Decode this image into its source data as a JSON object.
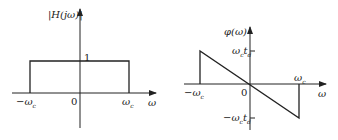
{
  "left_plot": {
    "y_label": "|H(jω)|",
    "level_label": "1",
    "origin_label": "0",
    "neg_cutoff_label": "−ω",
    "neg_cutoff_sub": "c",
    "pos_cutoff_label": "ω",
    "pos_cutoff_sub": "c",
    "x_label": "ω"
  },
  "right_plot": {
    "y_label": "φ(ω)",
    "top_label": "ω",
    "top_sub1": "c",
    "top_mid": "t",
    "top_sub2": "d",
    "bottom_label": "−ω",
    "bottom_sub1": "c",
    "bottom_mid": "t",
    "bottom_sub2": "d",
    "origin_label": "0",
    "neg_cutoff_label": "−ω",
    "neg_cutoff_sub": "c",
    "pos_cutoff_label": "ω",
    "pos_cutoff_sub": "c",
    "x_label": "ω"
  },
  "colors": {
    "line": "#222222",
    "background": "#ffffff"
  }
}
